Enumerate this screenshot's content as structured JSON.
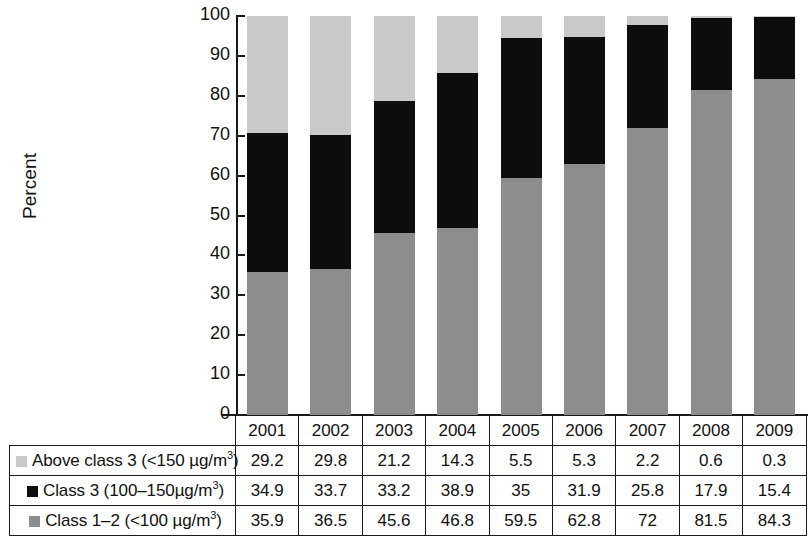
{
  "chart_data": {
    "type": "bar",
    "subtype": "stacked-bar-100-percent",
    "title": "",
    "xlabel": "",
    "ylabel": "Percent",
    "ylim": [
      0,
      100
    ],
    "yticks": [
      0,
      10,
      20,
      30,
      40,
      50,
      60,
      70,
      80,
      90,
      100
    ],
    "ytick_labels": [
      "0",
      "10",
      "20",
      "30",
      "40",
      "50",
      "60",
      "70",
      "80",
      "90",
      "100"
    ],
    "grid": false,
    "legend_position": "table-row-labels",
    "categories": [
      "2001",
      "2002",
      "2003",
      "2004",
      "2005",
      "2006",
      "2007",
      "2008",
      "2009"
    ],
    "series": [
      {
        "name": "Class 1–2 (<100 µg/m³)",
        "color": "#8d8d8d",
        "stack_order": 1,
        "values": [
          35.9,
          36.5,
          45.6,
          46.8,
          59.5,
          62.8,
          72,
          81.5,
          84.3
        ],
        "labels": [
          "35.9",
          "36.5",
          "45.6",
          "46.8",
          "59.5",
          "62.8",
          "72",
          "81.5",
          "84.3"
        ]
      },
      {
        "name": "Class 3 (100–150µg/m³)",
        "color": "#0d0d0d",
        "stack_order": 2,
        "values": [
          34.9,
          33.7,
          33.2,
          38.9,
          35,
          31.9,
          25.8,
          17.9,
          15.4
        ],
        "labels": [
          "34.9",
          "33.7",
          "33.2",
          "38.9",
          "35",
          "31.9",
          "25.8",
          "17.9",
          "15.4"
        ]
      },
      {
        "name": "Above class 3 (<150 µg/m³)",
        "color": "#c9c9c9",
        "stack_order": 3,
        "values": [
          29.2,
          29.8,
          21.2,
          14.3,
          5.5,
          5.3,
          2.2,
          0.6,
          0.3
        ],
        "labels": [
          "29.2",
          "29.8",
          "21.2",
          "14.3",
          "5.5",
          "5.3",
          "2.2",
          "0.6",
          "0.3"
        ]
      }
    ]
  },
  "table": {
    "year_header": [
      "2001",
      "2002",
      "2003",
      "2004",
      "2005",
      "2006",
      "2007",
      "2008",
      "2009"
    ],
    "rows": [
      {
        "label_prefix": "Above class 3 (<150 µg/m",
        "label_sup": "3",
        "label_suffix": ")",
        "swatch": "light-gray",
        "values": [
          "29.2",
          "29.8",
          "21.2",
          "14.3",
          "5.5",
          "5.3",
          "2.2",
          "0.6",
          "0.3"
        ]
      },
      {
        "label_prefix": "Class 3 (100–150µg/m",
        "label_sup": "3",
        "label_suffix": ")",
        "swatch": "black",
        "values": [
          "34.9",
          "33.7",
          "33.2",
          "38.9",
          "35",
          "31.9",
          "25.8",
          "17.9",
          "15.4"
        ]
      },
      {
        "label_prefix": "Class 1–2 (<100 µg/m",
        "label_sup": "3",
        "label_suffix": ")",
        "swatch": "medium-gray",
        "values": [
          "35.9",
          "36.5",
          "45.6",
          "46.8",
          "59.5",
          "62.8",
          "72",
          "81.5",
          "84.3"
        ]
      }
    ]
  },
  "colors": {
    "above_class_3": "#c9c9c9",
    "class_3": "#0d0d0d",
    "class_1_2": "#8d8d8d",
    "axis": "#1a1a1a",
    "background": "#ffffff"
  }
}
